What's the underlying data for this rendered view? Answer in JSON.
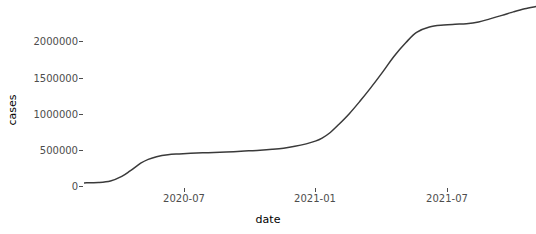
{
  "chart": {
    "type": "line",
    "title": "",
    "xlabel": "date",
    "ylabel": "cases",
    "background": "#ffffff",
    "line_color": "#3a3a3a",
    "line_width": 1.5,
    "grid": false,
    "legend": "none"
  },
  "y_axis": {
    "label": "cases",
    "ticks": [
      {
        "value": 0,
        "label": "0"
      },
      {
        "value": 500000,
        "label": "500000"
      },
      {
        "value": 1000000,
        "label": "1000000"
      },
      {
        "value": 1500000,
        "label": "1500000"
      },
      {
        "value": 2000000,
        "label": "2000000"
      }
    ],
    "min": -60000,
    "max": 2330000
  },
  "x_axis": {
    "label": "date",
    "ticks": [
      {
        "value": "2020-07",
        "label": "2020-07"
      },
      {
        "value": "2021-01",
        "label": "2021-01"
      },
      {
        "value": "2021-07",
        "label": "2021-07"
      }
    ],
    "min": "2020-03-01",
    "max": "2021-10-20"
  },
  "chart_data": {
    "type": "line",
    "title": "",
    "xlabel": "date",
    "ylabel": "cases",
    "grid": false,
    "legend": "none",
    "xlim": [
      "2020-03-01",
      "2021-10-20"
    ],
    "ylim": [
      -60000,
      2330000
    ],
    "xticks": [
      "2020-07",
      "2021-01",
      "2021-07"
    ],
    "yticks": [
      0,
      500000,
      1000000,
      1500000,
      2000000
    ],
    "series": [
      {
        "name": "cases",
        "color": "#3a3a3a",
        "x": [
          "2020-03-01",
          "2020-03-20",
          "2020-04-05",
          "2020-04-20",
          "2020-05-01",
          "2020-05-15",
          "2020-05-25",
          "2020-06-05",
          "2020-06-20",
          "2020-07-05",
          "2020-07-20",
          "2020-08-05",
          "2020-08-20",
          "2020-09-05",
          "2020-09-20",
          "2020-10-05",
          "2020-10-20",
          "2020-11-05",
          "2020-11-20",
          "2020-12-05",
          "2020-12-20",
          "2021-01-01",
          "2021-01-10",
          "2021-01-20",
          "2021-02-01",
          "2021-02-15",
          "2021-03-01",
          "2021-03-15",
          "2021-04-01",
          "2021-04-15",
          "2021-05-01",
          "2021-05-15",
          "2021-06-01",
          "2021-06-20",
          "2021-07-05",
          "2021-07-20",
          "2021-08-05",
          "2021-08-20",
          "2021-09-05",
          "2021-09-20",
          "2021-10-05",
          "2021-10-20"
        ],
        "y": [
          6000,
          10000,
          30000,
          90000,
          160000,
          260000,
          310000,
          345000,
          370000,
          380000,
          388000,
          394000,
          400000,
          406000,
          412000,
          420000,
          428000,
          440000,
          455000,
          478000,
          510000,
          545000,
          585000,
          650000,
          760000,
          900000,
          1060000,
          1230000,
          1450000,
          1640000,
          1820000,
          1950000,
          2020000,
          2045000,
          2055000,
          2062000,
          2085000,
          2125000,
          2170000,
          2215000,
          2255000,
          2285000
        ]
      }
    ]
  }
}
